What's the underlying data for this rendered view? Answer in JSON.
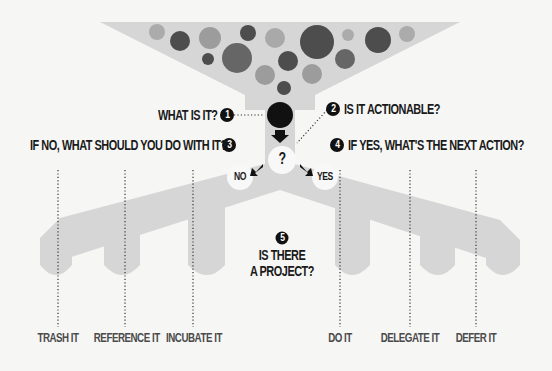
{
  "diagram": {
    "colors": {
      "background": "#f6f6f5",
      "funnel": "#d6d6d6",
      "branch": "#d6d6d6",
      "node_dark": "#111111",
      "node_light": "#f8f8f8",
      "text": "#1a1a1a",
      "outcome_text": "#4a4a4a",
      "bubble_dark": "#4a4a4a",
      "bubble_mid": "#6e6e6e",
      "bubble_light": "#a9a9a9"
    },
    "steps": [
      {
        "number": "1",
        "label": "WHAT IS IT?"
      },
      {
        "number": "2",
        "label": "IS IT ACTIONABLE?"
      },
      {
        "number": "3",
        "label": "IF NO, WHAT SHOULD YOU DO WITH IT?"
      },
      {
        "number": "4",
        "label": "IF YES, WHAT'S THE NEXT ACTION?"
      },
      {
        "number": "5",
        "label_line1": "IS THERE",
        "label_line2": "A PROJECT?"
      }
    ],
    "decision": {
      "symbol": "?",
      "no_label": "NO",
      "yes_label": "YES"
    },
    "outcomes_no": [
      "TRASH IT",
      "REFERENCE IT",
      "INCUBATE IT"
    ],
    "outcomes_yes": [
      "DO IT",
      "DELEGATE IT",
      "DEFER IT"
    ],
    "icons": {
      "funnel": "funnel-shape",
      "bubbles": "input-items-circles",
      "arrow": "down-arrow-icon"
    }
  }
}
